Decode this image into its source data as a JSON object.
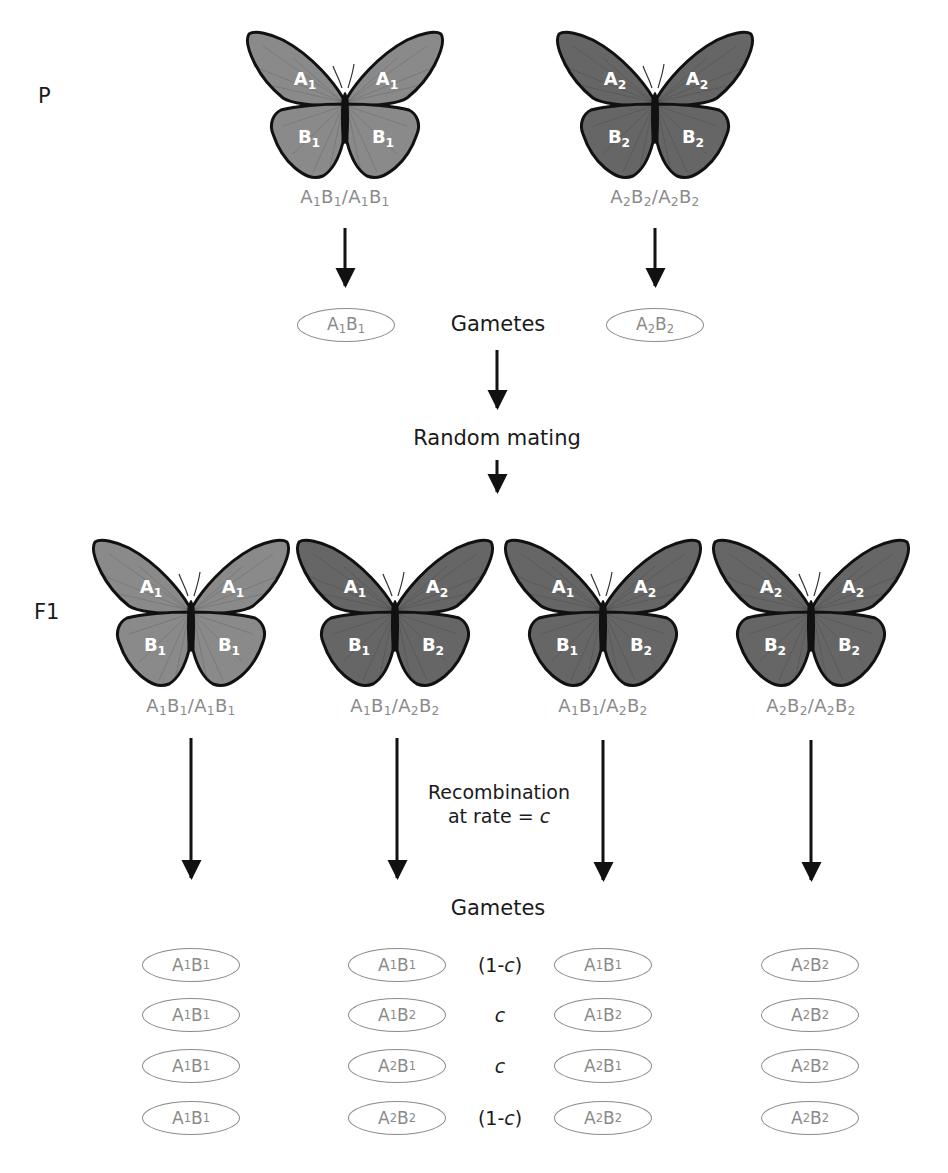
{
  "colors": {
    "light_wing": "#8a8a8a",
    "dark_wing": "#666666",
    "genotype_text": "#8a8a8a",
    "arrow": "#111111"
  },
  "generations": {
    "parental": {
      "label": "P"
    },
    "f1": {
      "label": "F1"
    }
  },
  "parents": [
    {
      "shade": "light",
      "wings": {
        "upper_left": [
          "A",
          "1"
        ],
        "upper_right": [
          "A",
          "1"
        ],
        "lower_left": [
          "B",
          "1"
        ],
        "lower_right": [
          "B",
          "1"
        ]
      },
      "genotype": "A1B1/A1B1"
    },
    {
      "shade": "dark",
      "wings": {
        "upper_left": [
          "A",
          "2"
        ],
        "upper_right": [
          "A",
          "2"
        ],
        "lower_left": [
          "B",
          "2"
        ],
        "lower_right": [
          "B",
          "2"
        ]
      },
      "genotype": "A2B2/A2B2"
    }
  ],
  "parent_gametes": [
    "A1B1",
    "A2B2"
  ],
  "labels": {
    "gametes_top": "Gametes",
    "random_mating": "Random mating",
    "recombination_line1": "Recombination",
    "recombination_line2": "at rate = c",
    "gametes_bottom": "Gametes"
  },
  "f1": [
    {
      "shade": "light",
      "wings": {
        "upper_left": [
          "A",
          "1"
        ],
        "upper_right": [
          "A",
          "1"
        ],
        "lower_left": [
          "B",
          "1"
        ],
        "lower_right": [
          "B",
          "1"
        ]
      },
      "genotype": "A1B1/A1B1"
    },
    {
      "shade": "dark",
      "wings": {
        "upper_left": [
          "A",
          "1"
        ],
        "upper_right": [
          "A",
          "2"
        ],
        "lower_left": [
          "B",
          "1"
        ],
        "lower_right": [
          "B",
          "2"
        ]
      },
      "genotype": "A1B1/A2B2"
    },
    {
      "shade": "dark",
      "wings": {
        "upper_left": [
          "A",
          "1"
        ],
        "upper_right": [
          "A",
          "2"
        ],
        "lower_left": [
          "B",
          "1"
        ],
        "lower_right": [
          "B",
          "2"
        ]
      },
      "genotype": "A1B1/A2B2"
    },
    {
      "shade": "dark",
      "wings": {
        "upper_left": [
          "A",
          "2"
        ],
        "upper_right": [
          "A",
          "2"
        ],
        "lower_left": [
          "B",
          "2"
        ],
        "lower_right": [
          "B",
          "2"
        ]
      },
      "genotype": "A2B2/A2B2"
    }
  ],
  "f1_gametes": {
    "columns": [
      [
        "A1B1",
        "A1B1",
        "A1B1",
        "A1B1"
      ],
      [
        "A1B1",
        "A1B2",
        "A2B1",
        "A2B2"
      ],
      [
        "A1B1",
        "A1B2",
        "A2B1",
        "A2B2"
      ],
      [
        "A2B2",
        "A2B2",
        "A2B2",
        "A2B2"
      ]
    ],
    "probabilities": [
      "(1-c)",
      "c",
      "c",
      "(1-c)"
    ]
  }
}
